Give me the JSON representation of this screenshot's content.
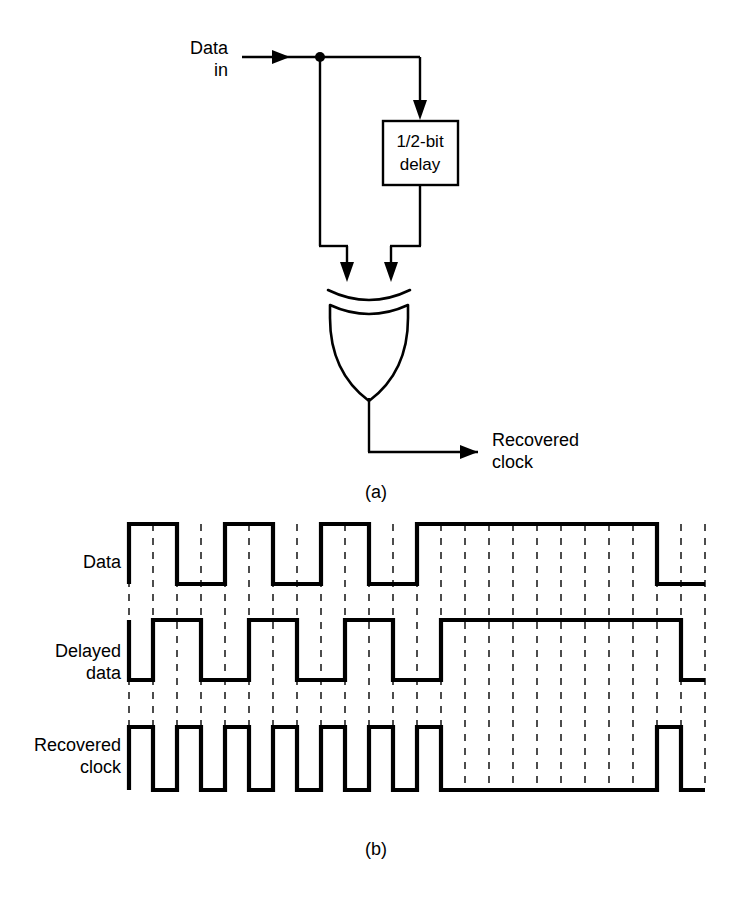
{
  "figure": {
    "title_a": "(a)",
    "title_b": "(b)",
    "background_color": "#ffffff",
    "ink_color": "#000000",
    "grid_color": "#4a4a4a"
  },
  "block_diagram": {
    "input_label_line1": "Data",
    "input_label_line2": "in",
    "delay_block_line1": "1/2-bit",
    "delay_block_line2": "delay",
    "gate_type": "xor-gate",
    "output_label_line1": "Recovered",
    "output_label_line2": "clock",
    "caption": "(a)"
  },
  "timing_diagram": {
    "caption": "(b)",
    "rows": [
      {
        "label_line1": "Data",
        "label_line2": ""
      },
      {
        "label_line1": "Delayed",
        "label_line2": "data"
      },
      {
        "label_line1": "Recovered",
        "label_line2": "clock"
      }
    ],
    "half_bit_px": 24,
    "grid_count": 24,
    "waveforms": {
      "data": {
        "name": "Data",
        "bits": [
          1,
          0,
          1,
          0,
          1,
          0,
          1,
          1,
          1,
          1,
          1,
          0
        ],
        "description": "NRZ data, high for bits 1,3,5 then long high run of five bits, then low"
      },
      "delayed_data": {
        "name": "Delayed data",
        "bits": [
          1,
          0,
          1,
          0,
          1,
          0,
          1,
          1,
          1,
          1,
          1,
          0
        ],
        "shift_half_bits": 1,
        "description": "Same NRZ pattern delayed by one half-bit interval"
      },
      "recovered_clock": {
        "name": "Recovered clock",
        "pulse_slots": [
          1,
          1,
          1,
          1,
          1,
          1,
          1,
          0,
          0,
          0,
          1,
          0
        ],
        "description": "XOR of data and delayed data: narrow half-bit pulse at every data transition; gap during the long high run"
      }
    }
  }
}
